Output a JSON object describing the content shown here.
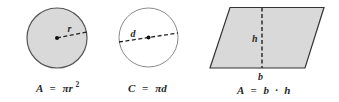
{
  "figures": [
    {
      "name": "circle-area",
      "fill": "#d9d9d9",
      "stroke": "#555555",
      "label": "r",
      "formula": {
        "lhs": "A",
        "eq": "=",
        "rhs_main": "πr",
        "rhs_sup": "2"
      }
    },
    {
      "name": "circle-circumference",
      "fill": "#ffffff",
      "stroke": "#8a8a8a",
      "label": "d",
      "formula": {
        "lhs": "C",
        "eq": "=",
        "rhs_main": "πd"
      }
    },
    {
      "name": "parallelogram-area",
      "fill": "#d9d9d9",
      "stroke": "#333333",
      "height_label": "h",
      "base_label": "b",
      "formula": {
        "lhs": "A",
        "eq": "=",
        "rhs_b": "b",
        "dot": "·",
        "rhs_h": "h"
      }
    }
  ]
}
